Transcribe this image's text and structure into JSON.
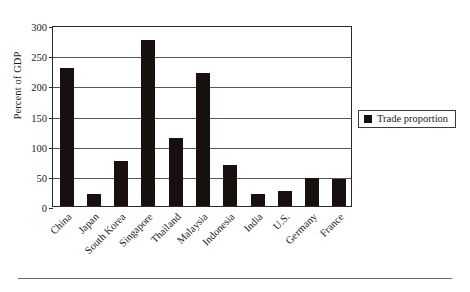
{
  "chart_data": {
    "type": "bar",
    "title": "",
    "xlabel": "",
    "ylabel": "Percent of GDP",
    "categories": [
      "China",
      "Japan",
      "South Korea",
      "Singapore",
      "Thailand",
      "Malaysia",
      "Indonesia",
      "India",
      "U.S.",
      "Germany",
      "France"
    ],
    "values": [
      228,
      20,
      74,
      275,
      112,
      220,
      68,
      20,
      25,
      46,
      45
    ],
    "series": [
      {
        "name": "Trade proportion",
        "color": "#17100f",
        "values": [
          228,
          20,
          74,
          275,
          112,
          220,
          68,
          20,
          25,
          46,
          45
        ]
      }
    ],
    "ylim": [
      0,
      300
    ],
    "yticks": [
      0,
      50,
      100,
      150,
      200,
      250,
      300
    ],
    "ytick_labels": [
      "0",
      "50",
      "100",
      "150",
      "200",
      "250",
      "300"
    ],
    "grid": true,
    "legend": {
      "position": "right",
      "entries": [
        {
          "label": "Trade proportion",
          "color": "#17100f",
          "marker": "square-marker"
        }
      ]
    }
  }
}
